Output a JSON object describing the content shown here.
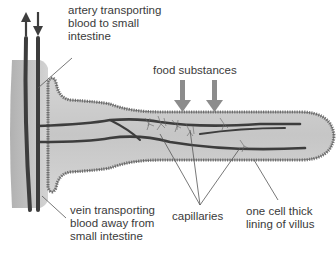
{
  "diagram": {
    "labels": {
      "artery": {
        "lines": [
          "artery transporting",
          "blood to small",
          "intestine"
        ]
      },
      "food": {
        "text": "food substances"
      },
      "vein": {
        "lines": [
          "vein transporting",
          "blood away from",
          "small intestine"
        ]
      },
      "capillaries": {
        "text": "capillaries"
      },
      "lining": {
        "lines": [
          "one cell thick",
          "lining of villus"
        ]
      }
    },
    "colors": {
      "villus_fill": "#c8c8c8",
      "villus_edge": "#8a8a8a",
      "vessel": "#3d3d3d",
      "arrow": "#8c8c8c",
      "text": "#3a3a3a",
      "leader": "#555555"
    }
  }
}
